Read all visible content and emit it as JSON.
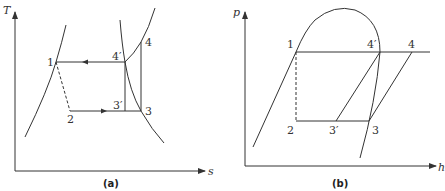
{
  "panel_a": {
    "caption": "(a)",
    "y_axis_label": "T",
    "x_axis_label": "s",
    "points": {
      "p1": "1",
      "p2": "2",
      "p3": "3",
      "p3prime": "3′",
      "p4": "4",
      "p4prime": "4′"
    }
  },
  "panel_b": {
    "caption": "(b)",
    "y_axis_label": "p",
    "x_axis_label": "h",
    "points": {
      "p1": "1",
      "p2": "2",
      "p3": "3",
      "p3prime": "3′",
      "p4": "4",
      "p4prime": "4′"
    }
  }
}
